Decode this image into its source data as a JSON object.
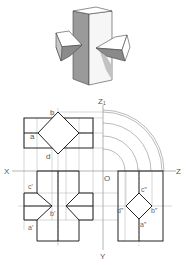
{
  "figure": {
    "type": "orthographic-projection-drawing",
    "isometric_view": {
      "description": "square prism with two square prisms penetrating from left and right sides"
    },
    "axes": {
      "x_label": "X",
      "z_label": "Z",
      "z1_label": "Z₁",
      "y_label": "Y",
      "origin_label": "O"
    },
    "front_view_labels": {
      "b": "b",
      "a": "a",
      "d": "d"
    },
    "top_view_labels": {
      "c": "c'",
      "b": "b'",
      "a": "a'"
    },
    "side_view_labels": {
      "c": "c”",
      "d": "d”",
      "b": "b”",
      "a": "a”"
    },
    "colors": {
      "outline": "#222222",
      "thin_line": "#777777",
      "shade_dark": "#8a8a8a",
      "shade_mid": "#b5b5b5",
      "shade_light": "#e8e8e8"
    }
  }
}
